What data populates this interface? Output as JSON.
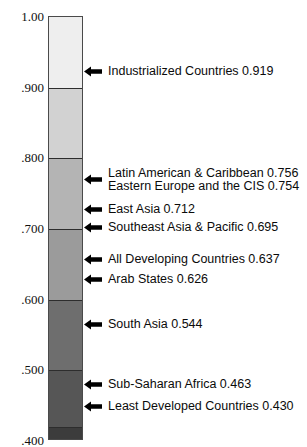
{
  "chart_data": {
    "type": "bar",
    "title": "",
    "subtitle": "",
    "xlabel": "",
    "ylabel": "",
    "ylim": [
      0.4,
      1.0
    ],
    "grid": false,
    "legend_position": "none",
    "orientation": "vertical-colorbar",
    "axis_ticks": [
      {
        "label": "1.00",
        "value": 1.0
      },
      {
        "label": ".900",
        "value": 0.9
      },
      {
        "label": ".800",
        "value": 0.8
      },
      {
        "label": ".700",
        "value": 0.7
      },
      {
        "label": ".600",
        "value": 0.6
      },
      {
        "label": ".500",
        "value": 0.5
      },
      {
        "label": ".400",
        "value": 0.4
      }
    ],
    "bands": [
      {
        "from": 0.9,
        "to": 1.0,
        "color": "#eeeeee"
      },
      {
        "from": 0.8,
        "to": 0.9,
        "color": "#d2d2d2"
      },
      {
        "from": 0.7,
        "to": 0.8,
        "color": "#b4b4b4"
      },
      {
        "from": 0.6,
        "to": 0.7,
        "color": "#9b9b9b"
      },
      {
        "from": 0.5,
        "to": 0.6,
        "color": "#6e6e6e"
      },
      {
        "from": 0.42,
        "to": 0.5,
        "color": "#565656"
      },
      {
        "from": 0.4,
        "to": 0.42,
        "color": "#3c3c3c"
      }
    ],
    "categories": [
      "Industrialized Countries",
      "Latin American & Caribbean",
      "Eastern Europe and the CIS",
      "East Asia",
      "Southeast Asia & Pacific",
      "All Developing Countries",
      "Arab States",
      "South Asia",
      "Sub-Saharan Africa",
      "Least Developed Countries"
    ],
    "values": [
      0.919,
      0.756,
      0.754,
      0.712,
      0.695,
      0.637,
      0.626,
      0.544,
      0.463,
      0.43
    ]
  },
  "annotations": [
    {
      "label": "Industrialized Countries 0.919",
      "name": "industrialized-countries",
      "value": 0.919,
      "arrow": true
    },
    {
      "label": "Latin American & Caribbean 0.756",
      "name": "latin-american-caribbean",
      "value": 0.756,
      "arrow": true
    },
    {
      "label": "Eastern Europe and the CIS 0.754",
      "name": "eastern-europe-cis",
      "value": 0.754,
      "arrow": false
    },
    {
      "label": "East Asia 0.712",
      "name": "east-asia",
      "value": 0.712,
      "arrow": true
    },
    {
      "label": "Southeast Asia & Pacific 0.695",
      "name": "southeast-asia-pacific",
      "value": 0.695,
      "arrow": true
    },
    {
      "label": "All Developing Countries 0.637",
      "name": "all-developing-countries",
      "value": 0.637,
      "arrow": true
    },
    {
      "label": "Arab States  0.626",
      "name": "arab-states",
      "value": 0.626,
      "arrow": true
    },
    {
      "label": "South Asia  0.544",
      "name": "south-asia",
      "value": 0.544,
      "arrow": true
    },
    {
      "label": "Sub-Saharan Africa  0.463",
      "name": "sub-saharan-africa",
      "value": 0.463,
      "arrow": true
    },
    {
      "label": "Least Developed Countries  0.430",
      "name": "least-developed-countries",
      "value": 0.43,
      "arrow": true
    }
  ],
  "colors": {
    "text": "#0b0b0b",
    "arrow": "#000000",
    "bar_border": "#4a4a4a",
    "band_divider": "#2d2d2d"
  }
}
